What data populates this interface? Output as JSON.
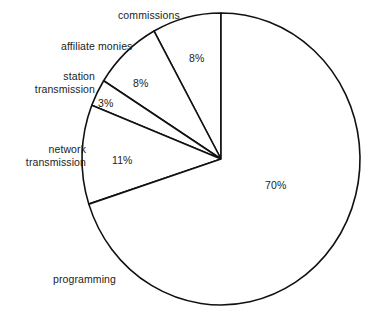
{
  "chart_data": {
    "type": "pie",
    "title": "",
    "subtitle": "",
    "xlabel": "",
    "ylabel": "",
    "legend_position": "none",
    "grid": false,
    "start_angle_deg": 90,
    "direction": "counterclockwise",
    "units": "percent",
    "categories": [
      "commissions",
      "affiliate monies",
      "station transmission",
      "network transmission",
      "programming"
    ],
    "values": [
      8,
      8,
      3,
      11,
      70
    ],
    "value_labels": [
      "8%",
      "8%",
      "3%",
      "11%",
      "70%"
    ],
    "slice_labels": [
      "commissions",
      "affiliate monies",
      "station\ntransmission",
      "network\ntransmission",
      "programming"
    ],
    "colors": [
      "#ffffff",
      "#ffffff",
      "#ffffff",
      "#ffffff",
      "#ffffff"
    ],
    "stroke_color": "#111111",
    "total": 100
  },
  "labels": {
    "commissions": "commissions",
    "affiliate_monies": "affiliate monies",
    "station_line1": "station",
    "station_line2": "transmission",
    "network_line1": "network",
    "network_line2": "transmission",
    "programming": "programming"
  },
  "geometry": {
    "center_x": 221,
    "center_y": 159,
    "radius_x": 139,
    "radius_y": 146
  }
}
